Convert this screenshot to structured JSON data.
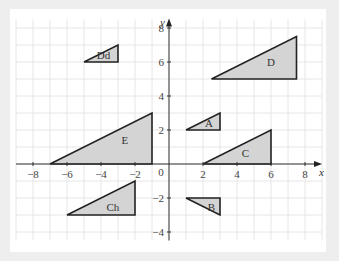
{
  "diagram": {
    "type": "coordinate-grid",
    "axes": {
      "x_label": "x",
      "y_label": "y",
      "origin_label": "0",
      "x_ticks": [
        {
          "value": -8,
          "label": "−8"
        },
        {
          "value": -6,
          "label": "−6"
        },
        {
          "value": -4,
          "label": "−4"
        },
        {
          "value": -2,
          "label": "−2"
        },
        {
          "value": 2,
          "label": "2"
        },
        {
          "value": 4,
          "label": "4"
        },
        {
          "value": 6,
          "label": "6"
        },
        {
          "value": 8,
          "label": "8"
        }
      ],
      "y_ticks": [
        {
          "value": 8,
          "label": "8"
        },
        {
          "value": 6,
          "label": "6"
        },
        {
          "value": 4,
          "label": "4"
        },
        {
          "value": 2,
          "label": "2"
        },
        {
          "value": -2,
          "label": "−2"
        },
        {
          "value": -4,
          "label": "−4"
        }
      ],
      "x_range": [
        -9,
        9
      ],
      "y_range": [
        -4.5,
        8.5
      ]
    },
    "colors": {
      "fill": "#d4d4d4",
      "stroke": "#222222",
      "grid": "#e6e6e6",
      "background": "#eeeeee"
    },
    "triangles": [
      {
        "name": "Dd",
        "label": "Dd",
        "vertices": [
          [
            -5,
            6
          ],
          [
            -3,
            6
          ],
          [
            -3,
            7
          ]
        ],
        "label_pos": [
          -3.85,
          6.2
        ]
      },
      {
        "name": "D",
        "label": "D",
        "vertices": [
          [
            2.5,
            5
          ],
          [
            7.5,
            5
          ],
          [
            7.5,
            7.5
          ]
        ],
        "label_pos": [
          6.0,
          5.75
        ]
      },
      {
        "name": "A",
        "label": "A",
        "vertices": [
          [
            1,
            2
          ],
          [
            3,
            2
          ],
          [
            3,
            3
          ]
        ],
        "label_pos": [
          2.35,
          2.2
        ]
      },
      {
        "name": "E",
        "label": "E",
        "vertices": [
          [
            -7,
            0
          ],
          [
            -1,
            0
          ],
          [
            -1,
            3
          ]
        ],
        "label_pos": [
          -2.6,
          1.2
        ]
      },
      {
        "name": "C",
        "label": "C",
        "vertices": [
          [
            2,
            0
          ],
          [
            6,
            0
          ],
          [
            6,
            2
          ]
        ],
        "label_pos": [
          4.5,
          0.4
        ]
      },
      {
        "name": "Ch",
        "label": "Ch",
        "vertices": [
          [
            -6,
            -3
          ],
          [
            -2,
            -3
          ],
          [
            -2,
            -1
          ]
        ],
        "label_pos": [
          -3.3,
          -2.75
        ]
      },
      {
        "name": "B",
        "label": "B",
        "vertices": [
          [
            1,
            -2
          ],
          [
            3,
            -2
          ],
          [
            3,
            -3
          ]
        ],
        "label_pos": [
          2.5,
          -2.75
        ]
      }
    ]
  }
}
